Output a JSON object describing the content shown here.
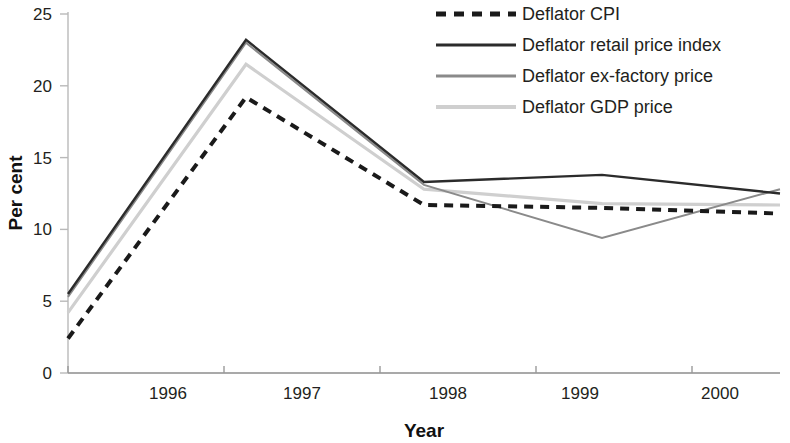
{
  "chart_data": {
    "type": "line",
    "title": "",
    "subtitle": "",
    "xlabel": "Year",
    "ylabel": "Per cent",
    "categories": [
      "1996",
      "1997",
      "1998",
      "1999",
      "2000"
    ],
    "x": [
      1996,
      1997,
      1998,
      1999,
      2000
    ],
    "xlim": [
      1996,
      2000
    ],
    "ylim": [
      0,
      25
    ],
    "yticks": [
      "0",
      "5",
      "10",
      "15",
      "20",
      "25"
    ],
    "ytick_values": [
      0,
      5,
      10,
      15,
      20,
      25
    ],
    "grid": false,
    "legend_position": "top-right",
    "series": [
      {
        "name": "Deflator CPI",
        "values": [
          2.4,
          19.2,
          11.7,
          11.5,
          11.1
        ],
        "style": "dashed",
        "color": "#1a1a1a",
        "width": 4
      },
      {
        "name": "Deflator retail price index",
        "values": [
          5.5,
          23.2,
          13.3,
          13.8,
          12.5
        ],
        "style": "solid",
        "color": "#2b2b2b",
        "width": 2.4
      },
      {
        "name": "Deflator ex-factory price",
        "values": [
          5.3,
          23.0,
          13.1,
          9.4,
          12.8
        ],
        "style": "solid",
        "color": "#8a8a8a",
        "width": 2.0
      },
      {
        "name": "Deflator GDP price",
        "values": [
          4.2,
          21.5,
          12.8,
          11.8,
          11.7
        ],
        "style": "solid",
        "color": "#cfcfcf",
        "width": 3.2
      }
    ]
  },
  "axes": {
    "ylabel": "Per cent",
    "xlabel": "Year"
  },
  "legend": {
    "entries": [
      {
        "label": "Deflator CPI"
      },
      {
        "label": "Deflator retail price index"
      },
      {
        "label": "Deflator ex-factory price"
      },
      {
        "label": "Deflator GDP price"
      }
    ]
  }
}
